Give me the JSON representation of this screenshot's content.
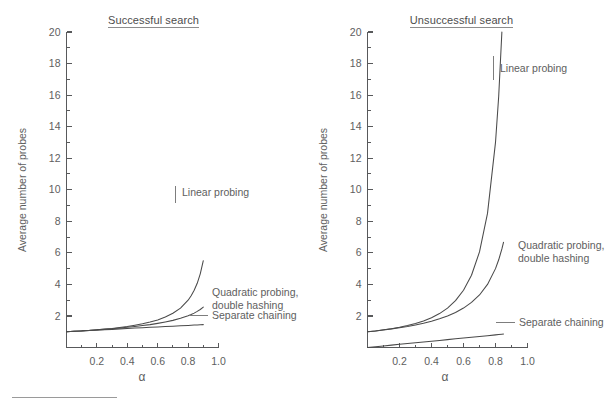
{
  "figure": {
    "background_color": "#ffffff",
    "line_color": "#4a4a4a",
    "text_color": "#5e5e5e",
    "axis_color": "#58595b"
  },
  "panels": [
    {
      "id": "successful",
      "title": "Successful search",
      "title_underlined": true,
      "ylabel": "Average number of probes",
      "xlabel": "α",
      "ytick_labels": [
        "2",
        "4",
        "6",
        "8",
        "10",
        "12",
        "14",
        "16",
        "18",
        "20"
      ],
      "xtick_labels": [
        "0.2",
        "0.4",
        "0.6",
        "0.8",
        "1.0"
      ],
      "annotations": [
        {
          "label": "Linear probing",
          "line2": ""
        },
        {
          "label": "Quadratic probing,",
          "line2": "double hashing"
        },
        {
          "label": "Separate chaining",
          "line2": ""
        }
      ]
    },
    {
      "id": "unsuccessful",
      "title": "Unsuccessful search",
      "title_underlined": true,
      "ylabel": "Average number of probes",
      "xlabel": "α",
      "ytick_labels": [
        "2",
        "4",
        "6",
        "8",
        "10",
        "12",
        "14",
        "16",
        "18",
        "20"
      ],
      "xtick_labels": [
        "0.2",
        "0.4",
        "0.6",
        "0.8",
        "1.0"
      ],
      "annotations": [
        {
          "label": "Linear probing",
          "line2": ""
        },
        {
          "label": "Quadratic probing,",
          "line2": "double hashing"
        },
        {
          "label": "Separate chaining",
          "line2": ""
        }
      ]
    }
  ],
  "chart_data": [
    {
      "type": "line",
      "title": "Successful search",
      "xlabel": "α",
      "ylabel": "Average number of probes",
      "xlim": [
        0,
        1.0
      ],
      "ylim": [
        0,
        20
      ],
      "grid": false,
      "legend_position": "inline-annotations",
      "xticks": [
        0.0,
        0.1,
        0.2,
        0.3,
        0.4,
        0.5,
        0.6,
        0.7,
        0.8,
        0.9,
        1.0
      ],
      "xtick_labels": [
        "",
        "",
        "0.2",
        "",
        "0.4",
        "",
        "0.6",
        "",
        "0.8",
        "",
        "1.0"
      ],
      "yticks": [
        0,
        2,
        4,
        6,
        8,
        10,
        12,
        14,
        16,
        18,
        20
      ],
      "ytick_labels": [
        "",
        "2",
        "4",
        "6",
        "8",
        "10",
        "12",
        "14",
        "16",
        "18",
        "20"
      ],
      "x": [
        0.0,
        0.05,
        0.1,
        0.15,
        0.2,
        0.25,
        0.3,
        0.35,
        0.4,
        0.45,
        0.5,
        0.55,
        0.6,
        0.65,
        0.7,
        0.75,
        0.8,
        0.82,
        0.84,
        0.86,
        0.88,
        0.9
      ],
      "series": [
        {
          "name": "Linear probing",
          "formula": "(1 + 1/(1 - a)) / 2",
          "values": [
            1.0,
            1.03,
            1.06,
            1.09,
            1.13,
            1.17,
            1.21,
            1.27,
            1.33,
            1.41,
            1.5,
            1.61,
            1.75,
            1.93,
            2.17,
            2.5,
            3.0,
            3.28,
            3.63,
            4.07,
            4.67,
            5.5
          ]
        },
        {
          "name": "Quadratic probing, double hashing",
          "formula": "-ln(1 - a) / a",
          "values": [
            1.0,
            1.03,
            1.05,
            1.08,
            1.12,
            1.15,
            1.19,
            1.23,
            1.28,
            1.33,
            1.39,
            1.45,
            1.53,
            1.62,
            1.72,
            1.85,
            2.01,
            2.09,
            2.18,
            2.29,
            2.41,
            2.56
          ]
        },
        {
          "name": "Separate chaining",
          "formula": "1 + a/2",
          "values": [
            1.0,
            1.03,
            1.05,
            1.08,
            1.1,
            1.13,
            1.15,
            1.18,
            1.2,
            1.23,
            1.25,
            1.28,
            1.3,
            1.33,
            1.35,
            1.38,
            1.4,
            1.41,
            1.42,
            1.43,
            1.44,
            1.45
          ]
        }
      ]
    },
    {
      "type": "line",
      "title": "Unsuccessful search",
      "xlabel": "α",
      "ylabel": "Average number of probes",
      "xlim": [
        0,
        1.0
      ],
      "ylim": [
        0,
        20
      ],
      "grid": false,
      "legend_position": "inline-annotations",
      "xticks": [
        0.0,
        0.1,
        0.2,
        0.3,
        0.4,
        0.5,
        0.6,
        0.7,
        0.8,
        0.9,
        1.0
      ],
      "xtick_labels": [
        "",
        "",
        "0.2",
        "",
        "0.4",
        "",
        "0.6",
        "",
        "0.8",
        "",
        "1.0"
      ],
      "yticks": [
        0,
        2,
        4,
        6,
        8,
        10,
        12,
        14,
        16,
        18,
        20
      ],
      "ytick_labels": [
        "",
        "2",
        "4",
        "6",
        "8",
        "10",
        "12",
        "14",
        "16",
        "18",
        "20"
      ],
      "x": [
        0.0,
        0.05,
        0.1,
        0.15,
        0.2,
        0.25,
        0.3,
        0.35,
        0.4,
        0.45,
        0.5,
        0.55,
        0.6,
        0.65,
        0.7,
        0.75,
        0.8,
        0.82,
        0.84,
        0.85
      ],
      "series": [
        {
          "name": "Linear probing",
          "formula": "(1 + 1/(1 - a)^2) / 2",
          "values": [
            1.0,
            1.05,
            1.12,
            1.19,
            1.28,
            1.39,
            1.52,
            1.68,
            1.89,
            2.15,
            2.5,
            2.97,
            3.63,
            4.58,
            6.06,
            8.5,
            13.0,
            15.93,
            20.03,
            22.72
          ]
        },
        {
          "name": "Quadratic probing, double hashing",
          "formula": "1/(1 - a)",
          "values": [
            1.0,
            1.05,
            1.11,
            1.18,
            1.25,
            1.33,
            1.43,
            1.54,
            1.67,
            1.82,
            2.0,
            2.22,
            2.5,
            2.86,
            3.33,
            4.0,
            5.0,
            5.56,
            6.25,
            6.67
          ]
        },
        {
          "name": "Separate chaining",
          "formula": "a",
          "values": [
            0.0,
            0.05,
            0.1,
            0.15,
            0.2,
            0.25,
            0.3,
            0.35,
            0.4,
            0.45,
            0.5,
            0.55,
            0.6,
            0.65,
            0.7,
            0.75,
            0.8,
            0.82,
            0.84,
            0.85
          ]
        }
      ]
    }
  ]
}
